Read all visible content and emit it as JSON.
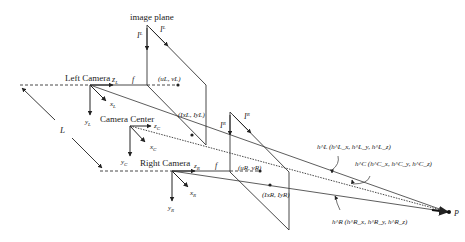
{
  "diagram": {
    "title": "image plane",
    "colors": {
      "stroke": "#333333",
      "text": "#222222",
      "background": "#ffffff"
    },
    "cameras": {
      "left": {
        "label": "Left Camera",
        "z": "z",
        "z_sub": "L",
        "x": "x",
        "x_sub": "L",
        "y": "y",
        "y_sub": "L",
        "f": "f",
        "principal": "(u",
        "principal_full": "(uL, vL)"
      },
      "center": {
        "label": "Camera Center",
        "z": "z",
        "z_sub": "C",
        "x": "x",
        "x_sub": "C",
        "y": "y",
        "y_sub": "C"
      },
      "right": {
        "label": "Right Camera",
        "z": "z",
        "z_sub": "R",
        "x": "x",
        "x_sub": "R",
        "y": "y",
        "y_sub": "R",
        "f": "f",
        "principal_full": "(uR, vR)"
      }
    },
    "image_planes": {
      "left": {
        "axis_y": "I",
        "axis_y_sup": "L",
        "axis_y_sub": "y",
        "axis_x": "I",
        "axis_x_sup": "L",
        "axis_x_sub": "x",
        "point": "(IxL, IyL)"
      },
      "right": {
        "axis_y": "I",
        "axis_y_sup": "R",
        "axis_y_sub": "y",
        "axis_x": "I",
        "axis_x_sup": "R",
        "axis_x_sub": "x",
        "point": "(IxR, IyR)"
      }
    },
    "baseline": "L",
    "rays": {
      "left": "h^L (h^L_x, h^L_y, h^L_z)",
      "center": "h^C (h^C_x, h^C_y, h^C_z)",
      "right": "h^R (h^R_x, h^R_y, h^R_z)"
    },
    "point_label": "P"
  }
}
